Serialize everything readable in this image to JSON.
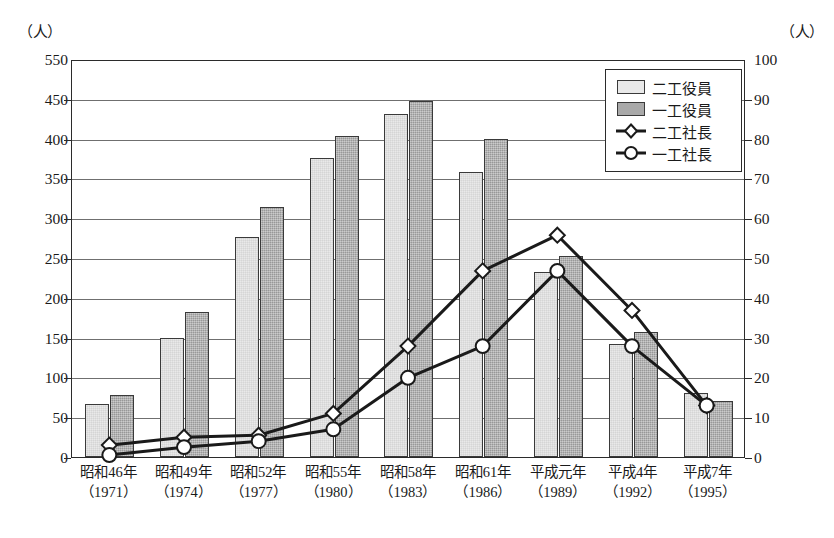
{
  "axes": {
    "left_unit": "（人）",
    "right_unit": "（人）",
    "left_ticks": [
      "550",
      "450",
      "400",
      "350",
      "300",
      "250",
      "200",
      "150",
      "100",
      "50",
      "0"
    ],
    "right_ticks": [
      "100",
      "90",
      "80",
      "70",
      "60",
      "50",
      "40",
      "30",
      "20",
      "10",
      "0"
    ]
  },
  "legend": {
    "items": [
      {
        "label": "二工役員",
        "key": "light-swatch"
      },
      {
        "label": "一工役員",
        "key": "dark-swatch"
      },
      {
        "label": "二工社長",
        "key": "diamond-marker"
      },
      {
        "label": "一工社長",
        "key": "circle-marker"
      }
    ]
  },
  "categories": [
    {
      "era": "昭和46年",
      "west": "（1971）"
    },
    {
      "era": "昭和49年",
      "west": "（1974）"
    },
    {
      "era": "昭和52年",
      "west": "（1977）"
    },
    {
      "era": "昭和55年",
      "west": "（1980）"
    },
    {
      "era": "昭和58年",
      "west": "（1983）"
    },
    {
      "era": "昭和61年",
      "west": "（1986）"
    },
    {
      "era": "平成元年",
      "west": "（1989）"
    },
    {
      "era": "平成4年",
      "west": "（1992）"
    },
    {
      "era": "平成7年",
      "west": "（1995）"
    }
  ],
  "chart_data": {
    "type": "bar",
    "title": "",
    "xlabel": "",
    "ylabel": "（人）",
    "y2label": "（人）",
    "grid": true,
    "legend_position": "top-right-inside",
    "categories": [
      "昭和46年（1971）",
      "昭和49年（1974）",
      "昭和52年（1977）",
      "昭和55年（1980）",
      "昭和58年（1983）",
      "昭和61年（1986）",
      "平成元年（1989）",
      "平成4年（1992）",
      "平成7年（1995）"
    ],
    "ylim": [
      0,
      550
    ],
    "ytick_values": [
      0,
      50,
      100,
      150,
      200,
      250,
      300,
      350,
      400,
      450,
      550
    ],
    "y2lim": [
      0,
      100
    ],
    "y2tick_values": [
      0,
      10,
      20,
      30,
      40,
      50,
      60,
      70,
      80,
      90,
      100
    ],
    "series": [
      {
        "name": "二工役員",
        "type": "bar",
        "axis": "left",
        "fill": "light-hatch",
        "values": [
          67,
          150,
          276,
          376,
          431,
          358,
          233,
          142,
          81
        ]
      },
      {
        "name": "一工役員",
        "type": "bar",
        "axis": "left",
        "fill": "dark-hatch",
        "values": [
          78,
          182,
          314,
          403,
          447,
          400,
          253,
          157,
          70
        ]
      },
      {
        "name": "二工社長",
        "type": "line",
        "axis": "right",
        "marker": "diamond",
        "values": [
          3,
          5,
          5.5,
          11,
          28,
          47,
          56,
          37,
          13
        ]
      },
      {
        "name": "一工社長",
        "type": "line",
        "axis": "right",
        "marker": "circle",
        "values": [
          0.5,
          2.5,
          4,
          7,
          20,
          28,
          47,
          28,
          13
        ]
      }
    ]
  },
  "colors": {
    "bar_light": "#e9e9e9",
    "bar_dark": "#a9a9a9",
    "line": "#1a1a1a",
    "grid": "#6f6f6f",
    "frame": "#2b2b2b"
  }
}
